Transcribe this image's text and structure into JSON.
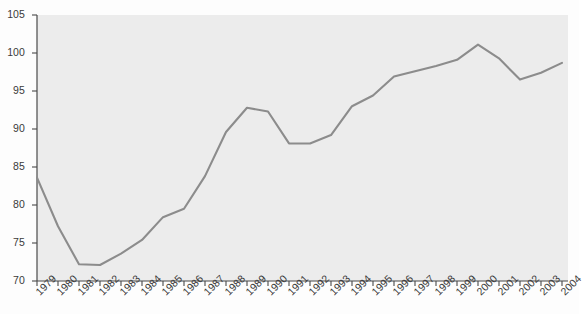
{
  "chart_data": {
    "type": "line",
    "title": "",
    "subtitle": "",
    "xlabel": "",
    "ylabel": "",
    "grid": false,
    "legend": "none",
    "xlim": [
      1979,
      2004
    ],
    "ylim": [
      70,
      105
    ],
    "yticks": [
      70,
      75,
      80,
      85,
      90,
      95,
      100,
      105
    ],
    "categories": [
      "1979",
      "1980",
      "1981",
      "1982",
      "1983",
      "1984",
      "1985",
      "1986",
      "1987",
      "1988",
      "1989",
      "1990",
      "1991",
      "1992",
      "1993",
      "1994",
      "1995",
      "1996",
      "1997",
      "1998",
      "1999",
      "2000",
      "2001",
      "2002",
      "2003",
      "2004"
    ],
    "values": [
      83.6,
      77.2,
      72.2,
      72.1,
      73.6,
      75.4,
      78.4,
      79.5,
      83.8,
      89.6,
      92.8,
      92.3,
      88.1,
      88.1,
      89.2,
      93.0,
      94.4,
      96.9,
      97.6,
      98.3,
      99.1,
      101.1,
      99.3,
      96.5,
      97.4,
      98.7
    ],
    "series": [
      {
        "name": "series-1",
        "color": "#8c8c8c",
        "values": [
          83.6,
          77.2,
          72.2,
          72.1,
          73.6,
          75.4,
          78.4,
          79.5,
          83.8,
          89.6,
          92.8,
          92.3,
          88.1,
          88.1,
          89.2,
          93.0,
          94.4,
          96.9,
          97.6,
          98.3,
          99.1,
          101.1,
          99.3,
          96.5,
          97.4,
          98.7
        ]
      }
    ],
    "annotations": [],
    "colors": {
      "line": "#8c8c8c",
      "plot_background": "#ececec",
      "page_background": "#fdfdfd",
      "axis": "#4a4a4a",
      "tick_text": "#3a3a3a"
    }
  }
}
